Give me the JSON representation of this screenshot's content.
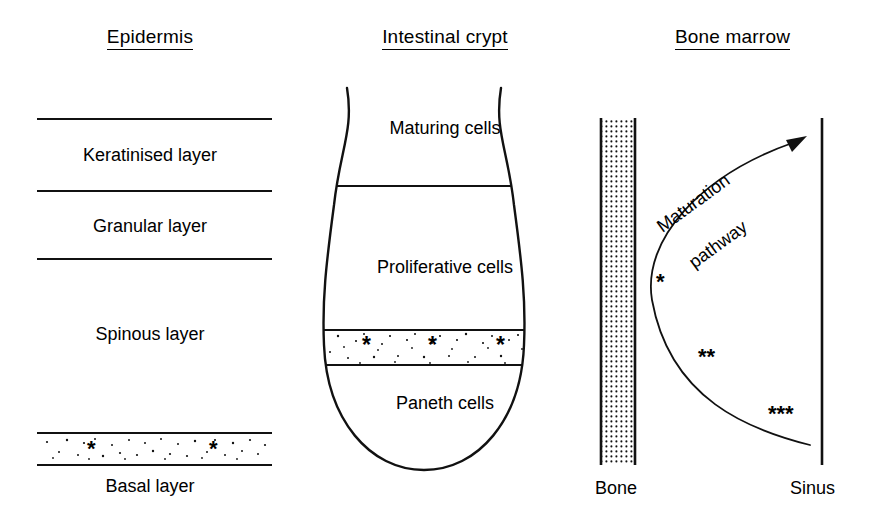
{
  "figure": {
    "type": "diagram",
    "stem_cell_marker": "*"
  },
  "panels": {
    "epidermis": {
      "title": "Epidermis",
      "layers": [
        {
          "label": "Keratinised layer",
          "stem_cells": 0
        },
        {
          "label": "Granular layer",
          "stem_cells": 0
        },
        {
          "label": "Spinous layer",
          "stem_cells": 0
        },
        {
          "label": "Basal layer",
          "stem_cells": 2,
          "stippled": true,
          "asterisks": "*"
        }
      ]
    },
    "crypt": {
      "title": "Intestinal crypt",
      "zones": [
        {
          "label": "Maturing cells",
          "stem_cells": 0
        },
        {
          "label": "Proliferative cells",
          "stem_cells": 0
        },
        {
          "label": "",
          "stem_cells": 3,
          "stippled": true,
          "asterisks": "*"
        },
        {
          "label": "Paneth cells",
          "stem_cells": 0
        }
      ]
    },
    "marrow": {
      "title": "Bone marrow",
      "left_label": "Bone",
      "right_label": "Sinus",
      "pathway_line1": "Maturation",
      "pathway_line2": "pathway",
      "markers": [
        {
          "label": "*",
          "count": 1
        },
        {
          "label": "**",
          "count": 2
        },
        {
          "label": "***",
          "count": 3
        }
      ]
    }
  },
  "colors": {
    "ink": "#111111",
    "background": "#ffffff"
  }
}
